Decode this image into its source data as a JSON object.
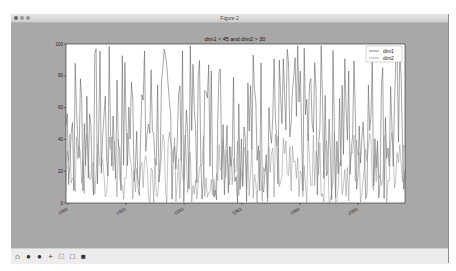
{
  "window": {
    "title": "Figure 2",
    "traffic_lights": [
      "close",
      "minimize",
      "zoom"
    ]
  },
  "toolbar": {
    "buttons": [
      {
        "name": "home-button",
        "icon": "home-icon",
        "glyph": "⌂"
      },
      {
        "name": "back-button",
        "icon": "back-arrow-icon",
        "glyph": "●"
      },
      {
        "name": "forward-button",
        "icon": "forward-arrow-icon",
        "glyph": "●"
      },
      {
        "name": "pan-button",
        "icon": "pan-move-icon",
        "glyph": "+"
      },
      {
        "name": "zoom-rect-button",
        "icon": "zoom-rect-icon",
        "glyph": "⊡"
      },
      {
        "name": "configure-subplots-button",
        "icon": "subplots-icon",
        "glyph": "□"
      },
      {
        "name": "save-button",
        "icon": "save-disk-icon",
        "glyph": "■"
      }
    ]
  },
  "chart_data": {
    "type": "line",
    "title": "dim1 < 45 and dim2 > 30",
    "xlabel": "",
    "ylabel": "",
    "ylim": [
      0,
      100
    ],
    "yticks": [
      "0",
      "20",
      "40",
      "60",
      "80",
      "100"
    ],
    "xticks": [
      "1903",
      "1923",
      "1943",
      "1963",
      "1983",
      "2003"
    ],
    "grid": false,
    "legend": {
      "position": "upper right",
      "entries": [
        "dim1",
        "dim2"
      ]
    },
    "series": [
      {
        "name": "dim1",
        "color": "#4f4f4f",
        "description": "random values spanning ~0-100, dense oscillation",
        "range": [
          0,
          100
        ]
      },
      {
        "name": "dim2",
        "color": "#8a8a8a",
        "description": "random values mostly ~0-45, dense oscillation",
        "range": [
          0,
          45
        ]
      }
    ]
  }
}
